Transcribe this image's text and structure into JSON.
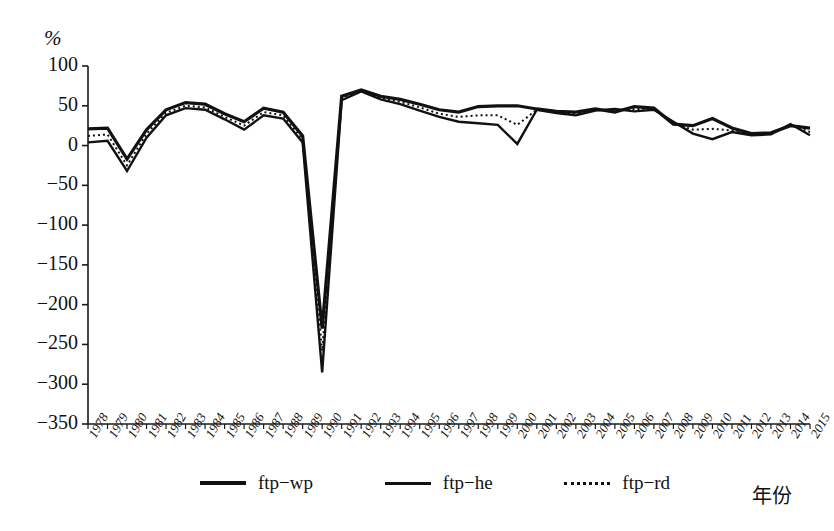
{
  "chart_data": {
    "type": "line",
    "title": "",
    "xlabel": "年份",
    "ylabel": "%",
    "ylim": [
      -350,
      100
    ],
    "ytick_values": [
      100,
      50,
      0,
      -50,
      -100,
      -150,
      -200,
      -250,
      -300,
      -350
    ],
    "ytick_labels": [
      "100",
      "50",
      "0",
      "−50",
      "−100",
      "−150",
      "−200",
      "−250",
      "−300",
      "−350"
    ],
    "grid": false,
    "legend_position": "bottom",
    "x": [
      1978,
      1979,
      1980,
      1981,
      1982,
      1983,
      1984,
      1985,
      1986,
      1987,
      1988,
      1989,
      1990,
      1991,
      1992,
      1993,
      1994,
      1995,
      1996,
      1997,
      1998,
      1999,
      2000,
      2001,
      2002,
      2003,
      2004,
      2005,
      2006,
      2007,
      2008,
      2009,
      2010,
      2011,
      2012,
      2013,
      2014,
      2015
    ],
    "categories": [
      "1978",
      "1979",
      "1980",
      "1981",
      "1982",
      "1983",
      "1984",
      "1985",
      "1986",
      "1987",
      "1988",
      "1989",
      "1990",
      "1991",
      "1992",
      "1993",
      "1994",
      "1995",
      "1996",
      "1997",
      "1998",
      "1999",
      "2000",
      "2001",
      "2002",
      "2003",
      "2004",
      "2005",
      "2006",
      "2007",
      "2008",
      "2009",
      "2010",
      "2011",
      "2012",
      "2013",
      "2014",
      "2015"
    ],
    "series": [
      {
        "name": "ftp-wp",
        "style": "solid-thick",
        "values": [
          21,
          22,
          -17,
          20,
          45,
          54,
          52,
          40,
          30,
          47,
          42,
          12,
          -230,
          62,
          70,
          62,
          58,
          52,
          45,
          42,
          49,
          50,
          50,
          46,
          43,
          42,
          46,
          42,
          49,
          47,
          27,
          25,
          34,
          22,
          15,
          16,
          25,
          22
        ]
      },
      {
        "name": "ftp-he",
        "style": "solid-thin",
        "values": [
          4,
          6,
          -32,
          10,
          38,
          47,
          45,
          33,
          20,
          38,
          34,
          4,
          -285,
          57,
          68,
          58,
          52,
          44,
          36,
          30,
          28,
          26,
          2,
          45,
          41,
          38,
          44,
          46,
          43,
          45,
          30,
          15,
          8,
          17,
          13,
          14,
          27,
          13
        ]
      },
      {
        "name": "ftp-rd",
        "style": "dotted",
        "values": [
          12,
          14,
          -25,
          15,
          41,
          50,
          48,
          36,
          25,
          42,
          38,
          8,
          -258,
          60,
          69,
          60,
          55,
          48,
          40,
          36,
          38,
          38,
          26,
          45,
          42,
          40,
          45,
          44,
          46,
          46,
          28,
          20,
          21,
          19,
          14,
          15,
          26,
          17
        ]
      }
    ]
  },
  "legend": {
    "entries": [
      {
        "label": "ftp−wp",
        "style": "solid-thick"
      },
      {
        "label": "ftp−he",
        "style": "solid-thin"
      },
      {
        "label": "ftp−rd",
        "style": "dotted"
      }
    ]
  },
  "axes": {
    "y_unit": "%",
    "x_title": "年份"
  },
  "colors": {
    "line": "#111111",
    "axis": "#1a1a1a",
    "background": "#ffffff"
  },
  "caption": ""
}
